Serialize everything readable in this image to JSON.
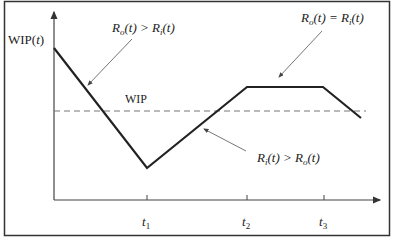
{
  "diagram": {
    "y_axis_label": "WIP(t)",
    "y_axis_label_parts": {
      "main": "WIP(",
      "var": "t",
      "close": ")"
    },
    "reference_line_label": "WIP",
    "x_ticks": [
      {
        "label": "t",
        "sub": "1",
        "x": 147
      },
      {
        "label": "t",
        "sub": "2",
        "x": 247
      },
      {
        "label": "t",
        "sub": "3",
        "x": 324
      }
    ],
    "annotations": [
      {
        "id": "outflow-greater",
        "R1": "R",
        "s1": "o",
        "mid1": "(t) > ",
        "R2": "R",
        "s2": "i",
        "end": "(t)"
      },
      {
        "id": "rates-equal",
        "R1": "R",
        "s1": "o",
        "mid1": "(t) = ",
        "R2": "R",
        "s2": "i",
        "end": "(t)"
      },
      {
        "id": "inflow-greater",
        "R1": "R",
        "s1": "i",
        "mid1": "(t) > ",
        "R2": "R",
        "s2": "o",
        "end": "(t)"
      }
    ],
    "curve_points": "54,48 147,168 247,87 323,87 361,118",
    "colors": {
      "curve": "#222222",
      "axis": "#444444",
      "dashed": "#777777",
      "arrow": "#666666",
      "frame": "#333333"
    }
  }
}
